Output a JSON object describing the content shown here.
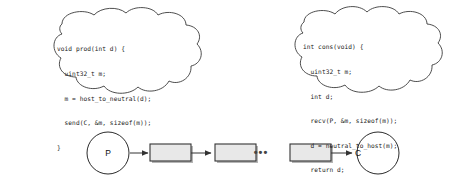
{
  "figure": {
    "background_color": "#ffffff",
    "stroke_color": "#333333",
    "box_fill_color": "#e8e8e8",
    "box_border_color": "#333333",
    "shadow_color": "#b5b5b5",
    "text_color": "#1a1a1a"
  },
  "clouds": [
    {
      "id": "producer-cloud",
      "name": "producer-code-cloud",
      "code_lines": [
        "void prod(int d) {",
        "  uint32_t m;",
        "  m = host_to_neutral(d);",
        "  send(C, &m, sizeof(m));",
        "}"
      ]
    },
    {
      "id": "consumer-cloud",
      "name": "consumer-code-cloud",
      "code_lines": [
        "int cons(void) {",
        "  uint32_t m;",
        "  int d;",
        "  recv(P, &m, sizeof(m));",
        "  d = neutral_to_host(m);",
        "  return d;",
        "}"
      ]
    }
  ],
  "pipeline": {
    "producer_node": {
      "label": "P",
      "shape": "circle"
    },
    "consumer_node": {
      "label": "C",
      "shape": "circle"
    },
    "buffers": [
      {
        "label": "",
        "shape": "rectangle"
      },
      {
        "label": "",
        "shape": "rectangle"
      },
      {
        "label": "",
        "shape": "rectangle"
      }
    ],
    "ellipsis": "•••",
    "arrows": [
      {
        "from": "P",
        "to": "buffer-1"
      },
      {
        "from": "buffer-1",
        "to": "buffer-2"
      },
      {
        "from": "buffer-3",
        "to": "C"
      }
    ]
  }
}
